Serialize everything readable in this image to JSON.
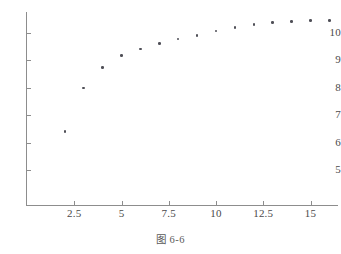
{
  "caption": "图 6-6",
  "chart_data": {
    "type": "scatter",
    "title": "",
    "subtitle": "",
    "xlabel": "",
    "ylabel": "",
    "x": [
      2,
      3,
      4,
      5,
      6,
      7,
      8,
      9,
      10,
      11,
      12,
      13,
      14,
      15,
      16
    ],
    "values": [
      6.4,
      8.0,
      8.75,
      9.17,
      9.42,
      9.62,
      9.78,
      9.9,
      10.08,
      10.2,
      10.32,
      10.38,
      10.42,
      10.45,
      10.45
    ],
    "series": [
      {
        "name": "series-1",
        "values": [
          6.4,
          8.0,
          8.75,
          9.17,
          9.42,
          9.62,
          9.78,
          9.9,
          10.08,
          10.2,
          10.32,
          10.38,
          10.42,
          10.45,
          10.45
        ]
      }
    ],
    "xlim": [
      0,
      16.5
    ],
    "ylim": [
      4.6,
      10.8
    ],
    "xticks": [
      2.5,
      5,
      7.5,
      10,
      12.5,
      15
    ],
    "yticks": [
      5,
      6,
      7,
      8,
      9,
      10
    ],
    "xtick_labels": [
      "2.5",
      "5",
      "7.5",
      "10",
      "12.5",
      "15"
    ],
    "ytick_labels": [
      "5",
      "6",
      "7",
      "8",
      "9",
      "10"
    ],
    "grid": false,
    "legend": false,
    "legend_position": "none",
    "marker_color": "#4f4f57",
    "axis_color": "#8d8d8d"
  }
}
